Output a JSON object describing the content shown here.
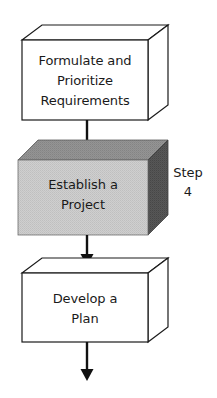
{
  "diagram": {
    "type": "3d-box-flowchart",
    "orientation": "vertical",
    "background_color": "#ffffff"
  },
  "nodes": [
    {
      "id": "formulate",
      "shape": "3d-box",
      "highlighted": false,
      "fill_color": "#ffffff",
      "stroke_color": "#1a1a1a",
      "lines": [
        "Formulate and",
        "Prioritize",
        "Requirements"
      ]
    },
    {
      "id": "establish",
      "shape": "3d-box",
      "highlighted": true,
      "fill_color": "#c9c9c9",
      "top_face_color": "#8e8e8e",
      "side_face_color": "#4f4f4f",
      "stroke_color": "#6e6e6e",
      "lines": [
        "Establish a",
        "Project"
      ],
      "annotation": {
        "id": "step-4",
        "lines": [
          "Step",
          "4"
        ]
      }
    },
    {
      "id": "develop",
      "shape": "3d-box",
      "highlighted": false,
      "fill_color": "#ffffff",
      "stroke_color": "#1a1a1a",
      "lines": [
        "Develop a",
        "Plan"
      ]
    }
  ],
  "connectors": [
    {
      "id": "arrow-1",
      "from": "formulate",
      "to": "establish",
      "style": "solid-arrow-down"
    },
    {
      "id": "arrow-2",
      "from": "establish",
      "to": "develop",
      "style": "solid-arrow-down"
    },
    {
      "id": "arrow-3",
      "from": "develop",
      "to": "",
      "style": "solid-arrow-down"
    }
  ]
}
